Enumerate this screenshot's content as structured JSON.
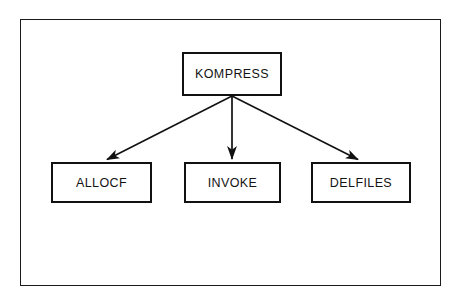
{
  "diagram": {
    "frame": {
      "border_color": "#1a1a1a"
    },
    "colors": {
      "node_border": "#111111",
      "node_fill": "#ffffff",
      "edge": "#111111",
      "text": "#131313",
      "background": "#ffffff"
    },
    "nodes": [
      {
        "id": "kompress",
        "label": "KOMPRESS",
        "level": "root"
      },
      {
        "id": "allocf",
        "label": "ALLOCF",
        "level": "child"
      },
      {
        "id": "invoke",
        "label": "INVOKE",
        "level": "child"
      },
      {
        "id": "delfiles",
        "label": "DELFILES",
        "level": "child"
      }
    ],
    "edges": [
      {
        "id": "edge-kompress-allocf",
        "from": "KOMPRESS",
        "to": "ALLOCF",
        "arrow": "single",
        "direction": "down-left"
      },
      {
        "id": "edge-kompress-invoke",
        "from": "KOMPRESS",
        "to": "INVOKE",
        "arrow": "single",
        "direction": "down"
      },
      {
        "id": "edge-kompress-delfiles",
        "from": "KOMPRESS",
        "to": "DELFILES",
        "arrow": "single",
        "direction": "down-right"
      }
    ]
  }
}
